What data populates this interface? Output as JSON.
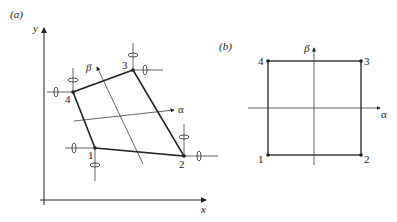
{
  "panel_a": {
    "label": "(a)",
    "axis_x": "x",
    "axis_y": "y",
    "alpha": "α",
    "beta": "β",
    "nodes": [
      {
        "id": "1",
        "x": 95,
        "y": 148
      },
      {
        "id": "2",
        "x": 184,
        "y": 156
      },
      {
        "id": "3",
        "x": 133,
        "y": 70
      },
      {
        "id": "4",
        "x": 73,
        "y": 92
      }
    ]
  },
  "panel_b": {
    "label": "(b)",
    "alpha": "α",
    "beta": "β",
    "nodes": [
      {
        "id": "1",
        "x": 268,
        "y": 155
      },
      {
        "id": "2",
        "x": 361,
        "y": 155
      },
      {
        "id": "3",
        "x": 361,
        "y": 61
      },
      {
        "id": "4",
        "x": 268,
        "y": 61
      }
    ]
  },
  "colors": {
    "ink": "#222222",
    "background": "#ffffff"
  }
}
